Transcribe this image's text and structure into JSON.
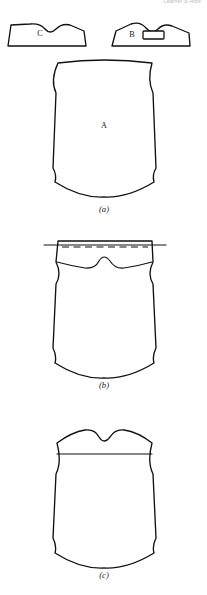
{
  "page": {
    "header_fragment": "Leather & Hide",
    "width": 207,
    "height": 595,
    "background": "#ffffff",
    "ink": "#111111"
  },
  "figure": {
    "panels": [
      {
        "caption": "(a)",
        "caption_x": 104,
        "caption_y": 212,
        "description": "Full hide panel A with offcut pieces B and C shown above"
      },
      {
        "caption": "(b)",
        "caption_x": 104,
        "caption_y": 388,
        "description": "Panel with top strip marked by solid and dashed cutting lines"
      },
      {
        "caption": "(c)",
        "caption_x": 104,
        "caption_y": 578,
        "description": "Panel after top strip removed, shaped neckline at top edge"
      }
    ],
    "pieces": [
      {
        "label": "C",
        "x": 40,
        "y": 34,
        "panel": "(a)"
      },
      {
        "label": "B",
        "x": 132,
        "y": 35,
        "panel": "(a)"
      },
      {
        "label": "A",
        "x": 104,
        "y": 126,
        "panel": "(a)"
      }
    ],
    "detail_rect": {
      "name": "piece-b-slot",
      "x": 143,
      "y": 31,
      "width": 21,
      "height": 8
    },
    "paths": {
      "piece_c": "M 8 46 L 11 25 L 30 24 Q 40 23 45 29 Q 50 35 56 29 Q 62 23 70 25 L 84 31 L 86 46 Z",
      "piece_b": "M 112 46 L 116 31 L 131 24 Q 140 21 146 28 Q 152 35 158 29 Q 164 23 172 26 L 189 33 L 190 46 Z",
      "panel_a": "M 58 63 Q 104 57 152 63 Q 147 80 153 93 L 156 168 Q 152 175 154 182 Q 128 198 104 197 Q 80 198 55 182 Q 57 175 53 168 L 56 93 Q 50 80 58 63 Z",
      "panel_b_outline": "M 58 241 L 152 241 L 153 262 Q 147 274 153 284 L 156 348 Q 152 356 154 363 Q 128 379 104 378 Q 80 379 55 363 Q 57 356 53 348 L 56 284 Q 62 274 56 262 L 58 241 Z",
      "panel_b_neck": "M 57 262 Q 72 266 85 268 Q 95 269 99 261 Q 104 253 110 261 Q 115 269 124 268 Q 138 266 152 262",
      "panel_b_cutline": "M 44 245 L 166 245",
      "panel_b_dashed": "M 62 247 L 148 247",
      "panel_c_outline": "M 57 443 Q 72 432 85 430 Q 95 429 99 437 Q 104 445 110 437 Q 115 429 124 430 Q 138 432 152 443 Q 147 462 153 474 L 156 538 Q 152 546 154 553 Q 128 569 104 568 Q 80 569 55 553 Q 57 546 53 538 L 56 474 Q 62 462 57 443 Z",
      "panel_c_line": "M 57 454 L 152 454"
    }
  }
}
